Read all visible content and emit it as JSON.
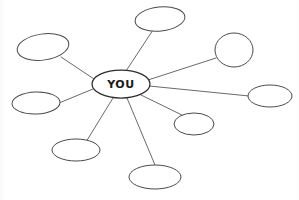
{
  "diagram": {
    "type": "spider-map",
    "center": {
      "label": "YOU",
      "cx": 121,
      "cy": 84,
      "rx": 29,
      "ry": 14
    },
    "style": {
      "background": "#ffffff",
      "line_color": "#58585c",
      "node_stroke": "#4a4a4e",
      "node_fill": "#ffffff",
      "center_stroke": "#2d2d30",
      "text_color": "#1a1a1a"
    },
    "nodes": [
      {
        "id": "node-top",
        "label": "",
        "cx": 160,
        "cy": 19,
        "rx": 25,
        "ry": 12,
        "rotate": -6
      },
      {
        "id": "node-top-right",
        "label": "",
        "cx": 234,
        "cy": 50,
        "rx": 19,
        "ry": 17,
        "rotate": 0
      },
      {
        "id": "node-right",
        "label": "",
        "cx": 270,
        "cy": 96,
        "rx": 22,
        "ry": 11,
        "rotate": 0
      },
      {
        "id": "node-lower-right",
        "label": "",
        "cx": 194,
        "cy": 124,
        "rx": 20,
        "ry": 11,
        "rotate": 0
      },
      {
        "id": "node-bottom",
        "label": "",
        "cx": 155,
        "cy": 177,
        "rx": 26,
        "ry": 12,
        "rotate": 0
      },
      {
        "id": "node-bottom-left",
        "label": "",
        "cx": 76,
        "cy": 150,
        "rx": 24,
        "ry": 11,
        "rotate": 0
      },
      {
        "id": "node-left",
        "label": "",
        "cx": 36,
        "cy": 103,
        "rx": 24,
        "ry": 11,
        "rotate": -2
      },
      {
        "id": "node-top-left",
        "label": "",
        "cx": 43,
        "cy": 47,
        "rx": 26,
        "ry": 13,
        "rotate": -8
      }
    ],
    "connections": [
      {
        "id": "link-top",
        "from": "center",
        "to": "node-top",
        "x1": 126,
        "y1": 71,
        "x2": 153,
        "y2": 30
      },
      {
        "id": "link-top-right",
        "from": "center",
        "to": "node-top-right",
        "x1": 148,
        "y1": 80,
        "x2": 216,
        "y2": 58
      },
      {
        "id": "link-right",
        "from": "center",
        "to": "node-right",
        "x1": 149,
        "y1": 86,
        "x2": 249,
        "y2": 96
      },
      {
        "id": "link-lower-right",
        "from": "center",
        "to": "node-lower-right",
        "x1": 141,
        "y1": 95,
        "x2": 184,
        "y2": 116
      },
      {
        "id": "link-bottom",
        "from": "center",
        "to": "node-bottom",
        "x1": 127,
        "y1": 98,
        "x2": 155,
        "y2": 165
      },
      {
        "id": "link-bottom-left",
        "from": "center",
        "to": "node-bottom-left",
        "x1": 113,
        "y1": 98,
        "x2": 86,
        "y2": 142
      },
      {
        "id": "link-left",
        "from": "center",
        "to": "node-left",
        "x1": 93,
        "y1": 89,
        "x2": 59,
        "y2": 103
      },
      {
        "id": "link-top-left",
        "from": "center",
        "to": "node-top-left",
        "x1": 94,
        "y1": 79,
        "x2": 61,
        "y2": 57
      }
    ]
  }
}
